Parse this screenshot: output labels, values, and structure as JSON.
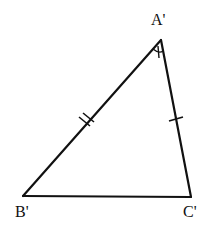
{
  "diagram": {
    "type": "triangle",
    "stroke_color": "#111111",
    "background": "#ffffff",
    "vertices": {
      "A": {
        "label": "A'",
        "x": 161,
        "y": 40
      },
      "B": {
        "label": "B'",
        "x": 23,
        "y": 196
      },
      "C": {
        "label": "C'",
        "x": 191,
        "y": 197
      }
    },
    "labels": {
      "A": "A'",
      "B": "B'",
      "C": "C'"
    },
    "marks": {
      "side_AB": "double tick (congruent)",
      "side_AC": "single tick (congruent)",
      "angle_A": "angle arc with single tick"
    }
  }
}
